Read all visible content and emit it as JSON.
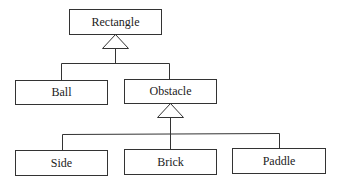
{
  "diagram": {
    "type": "uml-class-inheritance",
    "classes": [
      {
        "id": "rectangle",
        "label": "Rectangle"
      },
      {
        "id": "ball",
        "label": "Ball"
      },
      {
        "id": "obstacle",
        "label": "Obstacle"
      },
      {
        "id": "side",
        "label": "Side"
      },
      {
        "id": "brick",
        "label": "Brick"
      },
      {
        "id": "paddle",
        "label": "Paddle"
      }
    ],
    "generalizations": [
      {
        "parent": "Rectangle",
        "children": [
          "Ball",
          "Obstacle"
        ]
      },
      {
        "parent": "Obstacle",
        "children": [
          "Side",
          "Brick",
          "Paddle"
        ]
      }
    ],
    "colors": {
      "line": "#333333",
      "background": "#ffffff",
      "text": "#222222"
    }
  }
}
